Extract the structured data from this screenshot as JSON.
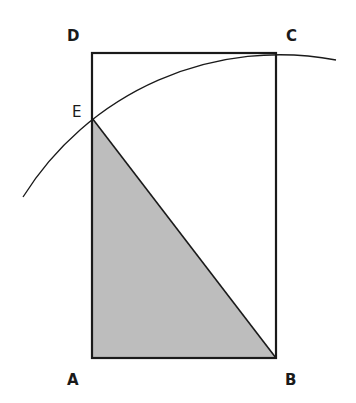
{
  "diagram": {
    "labels": {
      "A": "A",
      "B": "B",
      "C": "C",
      "D": "D",
      "E": "E"
    },
    "colors": {
      "stroke": "#1a1a1a",
      "fill": "#bdbdbd",
      "background": "#ffffff"
    },
    "shapes": {
      "rectangle": "ABCD",
      "shaded_triangle": "ABE",
      "arc": "circle centered at B through C and E"
    }
  }
}
